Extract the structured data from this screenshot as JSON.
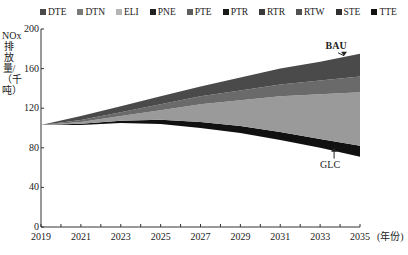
{
  "chart_data": {
    "type": "area",
    "stacked": true,
    "title": "",
    "xlabel": "(年份)",
    "ylabel": "NOx排放量/（千吨）",
    "ylim": [
      0,
      200
    ],
    "yticks": [
      0,
      40,
      80,
      120,
      160,
      200
    ],
    "xlim": [
      2019,
      2035
    ],
    "xticks_labeled": [
      2019,
      2021,
      2023,
      2025,
      2027,
      2029,
      2031,
      2033,
      2035
    ],
    "grid": false,
    "legend_position": "top",
    "legend": [
      "DTE",
      "DTN",
      "ELI",
      "PNE",
      "PTE",
      "PTR",
      "RTR",
      "RTW",
      "STE",
      "TTE"
    ],
    "x": [
      2019,
      2021,
      2023,
      2025,
      2027,
      2029,
      2031,
      2033,
      2035
    ],
    "glc_baseline": [
      103,
      104,
      106,
      106,
      103,
      99,
      93,
      86,
      79
    ],
    "bau_total": [
      103,
      112,
      122,
      132,
      142,
      151,
      160,
      167,
      175
    ],
    "bands_from_bottom": [
      {
        "name": "black reduction band",
        "values": [
          103,
          104,
          106,
          106,
          103,
          99,
          93,
          86,
          79
        ],
        "bottom_reduction": [
          0,
          1,
          1,
          2,
          3,
          4,
          5,
          6,
          8
        ]
      },
      {
        "name": "light gray band",
        "top": [
          103,
          106,
          112,
          118,
          124,
          128,
          132,
          134,
          136
        ]
      },
      {
        "name": "mid gray band",
        "top": [
          103,
          108,
          116,
          124,
          132,
          138,
          144,
          148,
          152
        ]
      },
      {
        "name": "dark gray band",
        "top": [
          103,
          112,
          122,
          132,
          142,
          151,
          160,
          167,
          175
        ]
      }
    ],
    "annotations": [
      {
        "text": "BAU",
        "x": 2034,
        "y": 178,
        "arrow_to": [
          2034,
          173
        ]
      },
      {
        "text": "GLC",
        "x": 2033.7,
        "y": 58,
        "arrow_to": [
          2033.7,
          80
        ]
      }
    ]
  },
  "colors": {
    "DTE": "#4a4a4a",
    "DTN": "#7a7a7a",
    "ELI": "#b5b5b5",
    "PNE": "#222222",
    "PTE": "#5e5e5e",
    "PTR": "#1a1a1a",
    "RTR": "#3a3a3a",
    "RTW": "#505050",
    "STE": "#303030",
    "TTE": "#111111"
  }
}
